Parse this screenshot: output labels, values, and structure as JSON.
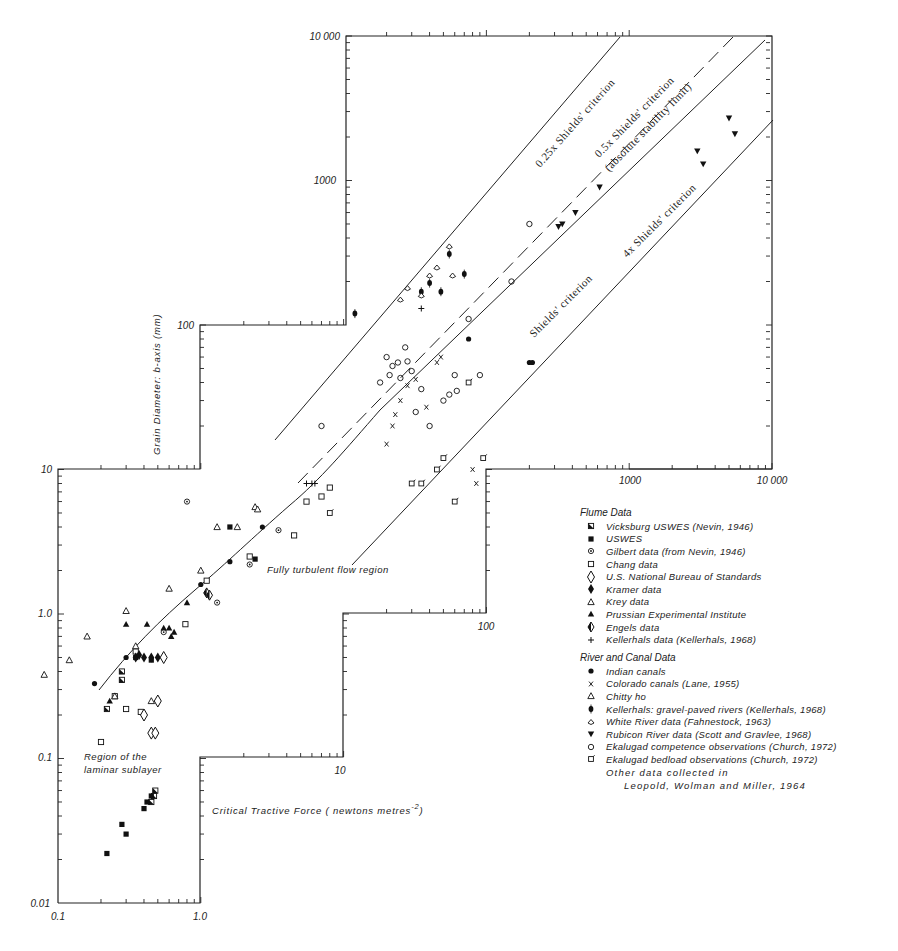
{
  "chart_data": {
    "type": "scatter",
    "title": "",
    "xlabel": "Critical Tractive Force ( newtons metres",
    "xlabel_superscript": "-2",
    "xlabel_close": ")",
    "ylabel": "Grain Diameter: b-axis (mm)",
    "xscale": "log",
    "yscale": "log",
    "xlim": [
      0.1,
      10000
    ],
    "ylim": [
      0.01,
      10000
    ],
    "grid": false,
    "x_tick_labels": [
      "0.1",
      "1.0",
      "10",
      "100",
      "1000",
      "10 000"
    ],
    "y_tick_labels": [
      "0.01",
      "0.1",
      "1.0",
      "10",
      "100",
      "1000",
      "10 000"
    ],
    "region_labels": [
      {
        "text": "Fully turbulent flow region",
        "x": 7.5,
        "y": 1.9
      },
      {
        "text": "Region of the",
        "x": 0.18,
        "y": 0.1
      },
      {
        "text": "laminar sublayer",
        "x": 0.18,
        "y": 0.08
      }
    ],
    "reference_lines": [
      {
        "name": "0.25x Shields' criterion",
        "style": "solid",
        "from": [
          6,
          30
        ],
        "to": [
          4500,
          10000
        ]
      },
      {
        "name": "0.5x Shields' criterion (absolute stability limit)",
        "style": "dashed",
        "from": [
          7,
          12
        ],
        "to": [
          9000,
          10000
        ]
      },
      {
        "name": "Shields' criterion",
        "style": "curve",
        "points": [
          [
            0.19,
            0.3
          ],
          [
            0.25,
            0.45
          ],
          [
            0.4,
            0.8
          ],
          [
            0.7,
            1.3
          ],
          [
            1.0,
            1.7
          ],
          [
            2,
            2.6
          ],
          [
            4,
            4.5
          ],
          [
            7,
            8
          ],
          [
            15,
            17
          ],
          [
            50,
            55
          ],
          [
            200,
            220
          ],
          [
            1000,
            1100
          ],
          [
            10000,
            10000
          ]
        ]
      },
      {
        "name": "4x Shields' criterion",
        "style": "solid",
        "from": [
          18,
          5
        ],
        "to": [
          9500,
          2500
        ]
      }
    ],
    "annotations": [
      "0.25x Shields' criterion",
      "0.5x Shields' criterion",
      "(absolute stability limit)",
      "Shields' criterion",
      "4x Shields' criterion"
    ],
    "legend_position": "right-middle",
    "series": [
      {
        "name": "Vicksburg USWES (Nevin, 1946)",
        "group": "Flume Data",
        "marker": "half-filled-square",
        "points": [
          [
            0.22,
            0.22
          ],
          [
            0.28,
            0.35
          ],
          [
            0.28,
            0.4
          ],
          [
            0.45,
            0.05
          ],
          [
            0.47,
            0.055
          ],
          [
            0.48,
            0.06
          ]
        ]
      },
      {
        "name": "USWES",
        "group": "Flume Data",
        "marker": "filled-square",
        "points": [
          [
            0.22,
            0.022
          ],
          [
            0.28,
            0.035
          ],
          [
            0.3,
            0.03
          ],
          [
            0.4,
            0.045
          ],
          [
            0.42,
            0.05
          ],
          [
            0.45,
            0.055
          ],
          [
            0.35,
            0.5
          ],
          [
            0.45,
            0.48
          ],
          [
            1.6,
            4
          ],
          [
            2.4,
            2.4
          ]
        ]
      },
      {
        "name": "Gilbert data (from Nevin, 1946)",
        "group": "Flume Data",
        "marker": "dotted-circle",
        "points": [
          [
            0.55,
            0.75
          ],
          [
            0.8,
            6
          ],
          [
            1.3,
            1.2
          ],
          [
            2.2,
            2.2
          ],
          [
            3.5,
            3.8
          ]
        ]
      },
      {
        "name": "Chang data",
        "group": "Flume Data",
        "marker": "open-square",
        "points": [
          [
            0.2,
            0.13
          ],
          [
            0.25,
            0.27
          ],
          [
            0.3,
            0.22
          ],
          [
            0.35,
            0.55
          ],
          [
            0.38,
            0.21
          ],
          [
            0.78,
            0.85
          ],
          [
            1.1,
            1.7
          ],
          [
            2.2,
            2.5
          ],
          [
            4.5,
            3.5
          ],
          [
            5.5,
            6
          ],
          [
            7,
            6.5
          ],
          [
            8,
            7.5
          ]
        ]
      },
      {
        "name": "U.S. National Bureau of Standards",
        "group": "Flume Data",
        "marker": "open-diamond",
        "points": [
          [
            0.4,
            0.2
          ],
          [
            0.45,
            0.15
          ],
          [
            0.48,
            0.15
          ],
          [
            0.5,
            0.25
          ],
          [
            0.55,
            0.5
          ]
        ]
      },
      {
        "name": "Kramer data",
        "group": "Flume Data",
        "marker": "filled-diamond",
        "points": [
          [
            0.35,
            0.5
          ],
          [
            0.37,
            0.52
          ],
          [
            0.4,
            0.5
          ],
          [
            0.45,
            0.5
          ],
          [
            0.5,
            0.5
          ]
        ]
      },
      {
        "name": "Krey data",
        "group": "Flume Data",
        "marker": "open-triangle",
        "points": [
          [
            0.08,
            0.38
          ],
          [
            0.12,
            0.48
          ],
          [
            0.16,
            0.7
          ],
          [
            0.25,
            0.27
          ],
          [
            0.3,
            1.05
          ],
          [
            0.35,
            0.6
          ],
          [
            0.45,
            0.25
          ],
          [
            0.6,
            1.5
          ],
          [
            1.0,
            2.0
          ],
          [
            1.3,
            4
          ],
          [
            1.8,
            4
          ],
          [
            2.4,
            5.5
          ],
          [
            2.5,
            5.3
          ]
        ]
      },
      {
        "name": "Prussian Experimental Institute",
        "group": "Flume Data",
        "marker": "filled-triangle",
        "points": [
          [
            0.23,
            0.25
          ],
          [
            0.3,
            0.85
          ],
          [
            0.42,
            0.85
          ],
          [
            0.55,
            0.8
          ],
          [
            0.6,
            0.8
          ],
          [
            0.62,
            0.7
          ],
          [
            0.65,
            0.75
          ],
          [
            0.8,
            1.2
          ]
        ]
      },
      {
        "name": "Engels data",
        "group": "Flume Data",
        "marker": "half-diamond",
        "points": [
          [
            1.1,
            1.4
          ],
          [
            1.15,
            1.35
          ]
        ]
      },
      {
        "name": "Kellerhals data (Kellerhals, 1968)",
        "group": "Flume Data",
        "marker": "plus",
        "points": [
          [
            5.5,
            8
          ],
          [
            6,
            8
          ],
          [
            6.3,
            8
          ],
          [
            35,
            130
          ]
        ]
      },
      {
        "name": "Indian canals",
        "group": "River and Canal Data",
        "marker": "filled-circle",
        "points": [
          [
            0.18,
            0.33
          ],
          [
            0.3,
            0.5
          ],
          [
            1.0,
            1.6
          ],
          [
            1.6,
            2.3
          ],
          [
            2.7,
            4
          ],
          [
            75,
            80
          ],
          [
            200,
            55
          ],
          [
            210,
            55
          ]
        ]
      },
      {
        "name": "Colorado canals (Lane, 1955)",
        "group": "River and Canal Data",
        "marker": "x",
        "points": [
          [
            20,
            15
          ],
          [
            22,
            20
          ],
          [
            23,
            24
          ],
          [
            25,
            30
          ],
          [
            28,
            38
          ],
          [
            32,
            42
          ],
          [
            38,
            27
          ],
          [
            45,
            55
          ],
          [
            48,
            60
          ],
          [
            80,
            10
          ],
          [
            85,
            8
          ]
        ]
      },
      {
        "name": "Chitty ho",
        "group": "River and Canal Data",
        "marker": "small-triangle",
        "points": []
      },
      {
        "name": "Kellerhals: gravel-paved rivers (Kellerhals, 1968)",
        "group": "River and Canal Data",
        "marker": "barred-circle",
        "points": [
          [
            12,
            120
          ],
          [
            35,
            170
          ],
          [
            40,
            195
          ],
          [
            48,
            170
          ],
          [
            55,
            310
          ],
          [
            70,
            225
          ]
        ]
      },
      {
        "name": "White River data (Fahnestock, 1963)",
        "group": "River and Canal Data",
        "marker": "open-circle-dot",
        "points": [
          [
            25,
            150
          ],
          [
            28,
            180
          ],
          [
            35,
            160
          ],
          [
            40,
            220
          ],
          [
            45,
            250
          ],
          [
            55,
            350
          ],
          [
            58,
            220
          ]
        ]
      },
      {
        "name": "Rubicon River data (Scott and Gravlee, 1968)",
        "group": "River and Canal Data",
        "marker": "filled-inverted-triangle",
        "points": [
          [
            320,
            480
          ],
          [
            340,
            500
          ],
          [
            420,
            600
          ],
          [
            620,
            900
          ],
          [
            3000,
            1600
          ],
          [
            3300,
            1300
          ],
          [
            5000,
            2700
          ],
          [
            5500,
            2100
          ]
        ]
      },
      {
        "name": "Ekalugad competence observations (Church, 1972)",
        "group": "River and Canal Data",
        "marker": "open-circle",
        "points": [
          [
            7,
            20
          ],
          [
            18,
            40
          ],
          [
            20,
            60
          ],
          [
            21,
            45
          ],
          [
            22,
            52
          ],
          [
            24,
            55
          ],
          [
            25,
            43
          ],
          [
            27,
            70
          ],
          [
            28,
            56
          ],
          [
            30,
            48
          ],
          [
            32,
            25
          ],
          [
            35,
            36
          ],
          [
            40,
            20
          ],
          [
            50,
            30
          ],
          [
            55,
            33
          ],
          [
            60,
            45
          ],
          [
            62,
            35
          ],
          [
            75,
            110
          ],
          [
            90,
            45
          ],
          [
            150,
            200
          ],
          [
            200,
            500
          ]
        ]
      },
      {
        "name": "Ekalugad bedload observations (Church, 1972)",
        "group": "River and Canal Data",
        "marker": "square-with-tail",
        "points": [
          [
            8,
            5
          ],
          [
            30,
            8
          ],
          [
            35,
            8
          ],
          [
            45,
            10
          ],
          [
            50,
            12
          ],
          [
            75,
            40
          ],
          [
            95,
            12
          ],
          [
            60,
            6
          ]
        ]
      }
    ]
  },
  "axes": {
    "y_labels": [
      "10 000",
      "1000",
      "100",
      "10",
      "1.0",
      "0.1",
      "0.01"
    ],
    "x_labels": [
      "0.1",
      "1.0",
      "10",
      "100",
      "1000",
      "10 000"
    ],
    "y_title": "Grain Diameter: b-axis (mm)",
    "x_title": "Critical Tractive Force ( newtons metres",
    "x_title_sup": "-2",
    "x_title_end": ")"
  },
  "regions": {
    "turbulent": "Fully turbulent flow region",
    "laminar_1": "Region of the",
    "laminar_2": "laminar sublayer"
  },
  "line_labels": {
    "quarter": "0.25x Shields' criterion",
    "half": "0.5x Shields' criterion",
    "half_sub": "(absolute stability limit)",
    "shields": "Shields' criterion",
    "four": "4x Shields' criterion"
  },
  "legend": {
    "flume_title": "Flume Data",
    "flume": [
      "Vicksburg USWES (Nevin, 1946)",
      "USWES",
      "Gilbert data (from Nevin, 1946)",
      "Chang data",
      "U.S. National Bureau of Standards",
      "Kramer data",
      "Krey data",
      "Prussian Experimental Institute",
      "Engels data",
      "Kellerhals data (Kellerhals, 1968)"
    ],
    "river_title": "River and Canal Data",
    "river": [
      "Indian canals",
      "Colorado canals (Lane, 1955)",
      "Chitty ho",
      "Kellerhals: gravel-paved rivers (Kellerhals, 1968)",
      "White River data (Fahnestock, 1963)",
      "Rubicon River data (Scott and Gravlee, 1968)",
      "Ekalugad competence observations (Church, 1972)",
      "Ekalugad bedload observations (Church, 1972)"
    ],
    "note_1": "Other data collected in",
    "note_2": "Leopold, Wolman and Miller, 1964"
  }
}
